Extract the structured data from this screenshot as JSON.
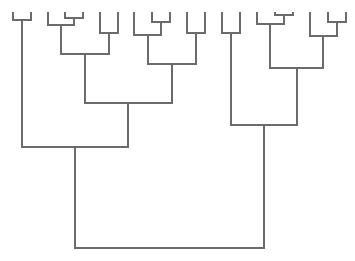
{
  "diagram": {
    "type": "dendrogram",
    "orientation": "top-down",
    "line_color": "#6b6b6b",
    "background": "#ffffff",
    "leaves": [
      {
        "id": "L1",
        "x": 13
      },
      {
        "id": "L2",
        "x": 31
      },
      {
        "id": "L3",
        "x": 48
      },
      {
        "id": "L4",
        "x": 65
      },
      {
        "id": "L5",
        "x": 83
      },
      {
        "id": "L6",
        "x": 100
      },
      {
        "id": "L7",
        "x": 118
      },
      {
        "id": "L8",
        "x": 134
      },
      {
        "id": "L9",
        "x": 152
      },
      {
        "id": "L10",
        "x": 170
      },
      {
        "id": "L11",
        "x": 187
      },
      {
        "id": "L12",
        "x": 205
      },
      {
        "id": "L13",
        "x": 222
      },
      {
        "id": "L14",
        "x": 240
      },
      {
        "id": "L15",
        "x": 257
      },
      {
        "id": "L16",
        "x": 275
      },
      {
        "id": "L17",
        "x": 293
      },
      {
        "id": "L18",
        "x": 310
      },
      {
        "id": "L19",
        "x": 328
      },
      {
        "id": "L20",
        "x": 346
      }
    ],
    "leaf_top_y": 12,
    "merges": [
      {
        "id": "m1",
        "left": {
          "x": 13,
          "y": 12
        },
        "right": {
          "x": 31,
          "y": 12
        },
        "y": 20,
        "x": 22
      },
      {
        "id": "m2",
        "left": {
          "x": 65,
          "y": 12
        },
        "right": {
          "x": 83,
          "y": 12
        },
        "y": 18,
        "x": 74
      },
      {
        "id": "m3",
        "left": {
          "x": 48,
          "y": 12
        },
        "right": {
          "x": 74,
          "y": 18
        },
        "y": 25,
        "x": 61
      },
      {
        "id": "m4",
        "left": {
          "x": 100,
          "y": 12
        },
        "right": {
          "x": 118,
          "y": 12
        },
        "y": 33,
        "x": 109
      },
      {
        "id": "m5",
        "left": {
          "x": 61,
          "y": 25
        },
        "right": {
          "x": 109,
          "y": 33
        },
        "y": 54,
        "x": 85
      },
      {
        "id": "m6",
        "left": {
          "x": 152,
          "y": 12
        },
        "right": {
          "x": 170,
          "y": 12
        },
        "y": 22,
        "x": 161
      },
      {
        "id": "m7",
        "left": {
          "x": 134,
          "y": 12
        },
        "right": {
          "x": 161,
          "y": 22
        },
        "y": 35,
        "x": 148
      },
      {
        "id": "m8",
        "left": {
          "x": 187,
          "y": 12
        },
        "right": {
          "x": 205,
          "y": 12
        },
        "y": 33,
        "x": 196
      },
      {
        "id": "m9",
        "left": {
          "x": 148,
          "y": 35
        },
        "right": {
          "x": 196,
          "y": 33
        },
        "y": 64,
        "x": 172
      },
      {
        "id": "m10",
        "left": {
          "x": 85,
          "y": 54
        },
        "right": {
          "x": 172,
          "y": 64
        },
        "y": 103,
        "x": 128
      },
      {
        "id": "m11",
        "left": {
          "x": 22,
          "y": 20
        },
        "right": {
          "x": 128,
          "y": 103
        },
        "y": 147,
        "x": 75
      },
      {
        "id": "m12",
        "left": {
          "x": 222,
          "y": 12
        },
        "right": {
          "x": 240,
          "y": 12
        },
        "y": 33,
        "x": 231
      },
      {
        "id": "m13",
        "left": {
          "x": 275,
          "y": 12
        },
        "right": {
          "x": 293,
          "y": 12
        },
        "y": 15,
        "x": 284
      },
      {
        "id": "m14",
        "left": {
          "x": 257,
          "y": 12
        },
        "right": {
          "x": 284,
          "y": 15
        },
        "y": 24,
        "x": 270
      },
      {
        "id": "m15",
        "left": {
          "x": 328,
          "y": 12
        },
        "right": {
          "x": 346,
          "y": 12
        },
        "y": 22,
        "x": 337
      },
      {
        "id": "m16",
        "left": {
          "x": 310,
          "y": 12
        },
        "right": {
          "x": 337,
          "y": 22
        },
        "y": 36,
        "x": 323
      },
      {
        "id": "m17",
        "left": {
          "x": 270,
          "y": 24
        },
        "right": {
          "x": 323,
          "y": 36
        },
        "y": 68,
        "x": 297
      },
      {
        "id": "m18",
        "left": {
          "x": 231,
          "y": 33
        },
        "right": {
          "x": 297,
          "y": 68
        },
        "y": 125,
        "x": 264
      },
      {
        "id": "m19",
        "left": {
          "x": 75,
          "y": 147
        },
        "right": {
          "x": 264,
          "y": 125
        },
        "y": 248,
        "x": 170
      }
    ]
  }
}
